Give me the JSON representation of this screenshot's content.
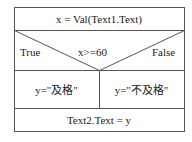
{
  "diagram": {
    "type": "nassi-shneiderman",
    "colors": {
      "line": "#555555",
      "text": "#222222",
      "background": "#ffffff"
    },
    "statement_top": "x = Val(Text1.Text)",
    "condition": {
      "text": "x>=60",
      "true_label": "True",
      "false_label": "False"
    },
    "branches": {
      "true_statement": "y=\"及格\"",
      "false_statement": "y=\"不及格\""
    },
    "statement_bottom": "Text2.Text = y"
  }
}
